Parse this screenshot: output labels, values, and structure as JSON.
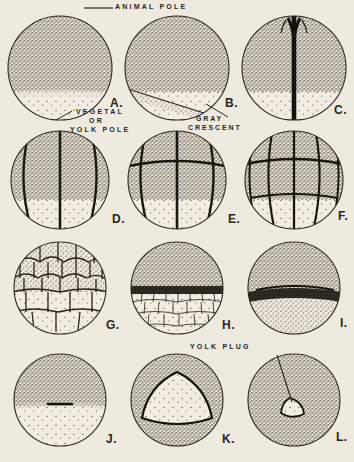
{
  "plate": {
    "title": "Frog Embryo Development Stages",
    "background_color": "#efeae0",
    "ink_color": "#2a2622",
    "columns": 3,
    "rows": 4
  },
  "callouts": [
    {
      "id": "animal-pole",
      "text": "ANIMAL POLE"
    },
    {
      "id": "vegetal-or-yolk-pole-line1",
      "text": "VEGETAL"
    },
    {
      "id": "vegetal-or-yolk-pole-line2",
      "text": "OR"
    },
    {
      "id": "vegetal-or-yolk-pole-line3",
      "text": "YOLK POLE"
    },
    {
      "id": "gray-crescent-line1",
      "text": "GRAY"
    },
    {
      "id": "gray-crescent-line2",
      "text": "CRESCENT"
    },
    {
      "id": "yolk-plug",
      "text": "YOLK PLUG"
    }
  ],
  "panels": [
    {
      "letter": "A.",
      "stage": "uncleaved-egg",
      "row": 1,
      "col": 1
    },
    {
      "letter": "B.",
      "stage": "gray-crescent-egg",
      "row": 1,
      "col": 2
    },
    {
      "letter": "C.",
      "stage": "two-cell",
      "row": 1,
      "col": 3
    },
    {
      "letter": "D.",
      "stage": "four-cell",
      "row": 2,
      "col": 1
    },
    {
      "letter": "E.",
      "stage": "eight-cell",
      "row": 2,
      "col": 2
    },
    {
      "letter": "F.",
      "stage": "sixteen-cell",
      "row": 2,
      "col": 3
    },
    {
      "letter": "G.",
      "stage": "morula",
      "row": 3,
      "col": 1
    },
    {
      "letter": "H.",
      "stage": "blastula",
      "row": 3,
      "col": 2
    },
    {
      "letter": "I.",
      "stage": "early-gastrula",
      "row": 3,
      "col": 3
    },
    {
      "letter": "J.",
      "stage": "blastopore-slit",
      "row": 4,
      "col": 1
    },
    {
      "letter": "K.",
      "stage": "large-yolk-plug",
      "row": 4,
      "col": 2
    },
    {
      "letter": "L.",
      "stage": "small-yolk-plug",
      "row": 4,
      "col": 3
    }
  ]
}
